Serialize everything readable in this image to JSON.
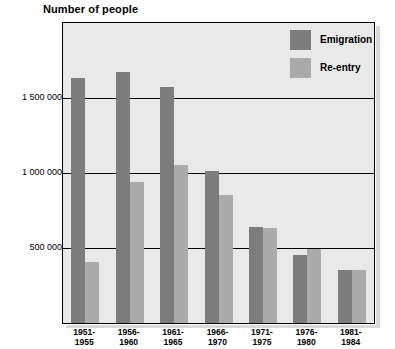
{
  "chart_data": {
    "type": "bar",
    "title": "Number of people",
    "xlabel": "",
    "ylabel": "",
    "ylim": [
      0,
      2000000
    ],
    "grid": true,
    "legend_position": "top-right",
    "categories": [
      "1951-\n1955",
      "1956-\n1960",
      "1961-\n1965",
      "1966-\n1970",
      "1971-\n1975",
      "1976-\n1980",
      "1981-\n1984"
    ],
    "category_lines": [
      {
        "line1": "1951-",
        "line2": "1955"
      },
      {
        "line1": "1956-",
        "line2": "1960"
      },
      {
        "line1": "1961-",
        "line2": "1965"
      },
      {
        "line1": "1966-",
        "line2": "1970"
      },
      {
        "line1": "1971-",
        "line2": "1975"
      },
      {
        "line1": "1976-",
        "line2": "1980"
      },
      {
        "line1": "1981-",
        "line2": "1984"
      }
    ],
    "ytick_values": [
      500000,
      1000000,
      1500000
    ],
    "ytick_labels": [
      "500 000",
      "1 000 000",
      "1 500 000"
    ],
    "series": [
      {
        "name": "Emigration",
        "color": "#7d7d7d",
        "values": [
          1635000,
          1670000,
          1575000,
          1010000,
          640000,
          450000,
          355000
        ]
      },
      {
        "name": "Re-entry",
        "color": "#ababab",
        "values": [
          410000,
          940000,
          1050000,
          855000,
          635000,
          495000,
          355000
        ]
      }
    ]
  },
  "legend": {
    "items": [
      {
        "label": "Emigration",
        "color": "#7d7d7d"
      },
      {
        "label": "Re-entry",
        "color": "#ababab"
      }
    ]
  },
  "colors": {
    "plot_background": "#e9e9e9",
    "page_background": "#ffffff",
    "axis": "#000000",
    "emigration": "#7d7d7d",
    "reentry": "#ababab"
  }
}
